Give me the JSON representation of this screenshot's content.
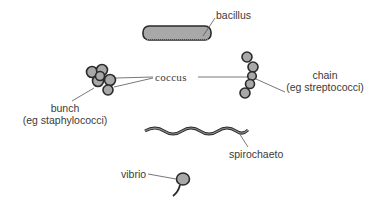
{
  "diagram": {
    "labels": {
      "bacillus": "bacillus",
      "coccus": "coccus",
      "bunch": "bunch",
      "bunch_example": "(eg staphylococci)",
      "chain": "chain",
      "chain_example": "(eg streptococci)",
      "spirochaete": "spirochaeto",
      "vibrio": "vibrio"
    },
    "colors": {
      "cell_fill": "#a8a8a8",
      "cell_stroke": "#2a2a2a",
      "leader_line": "#555555",
      "text": "#3a3a3a"
    }
  }
}
